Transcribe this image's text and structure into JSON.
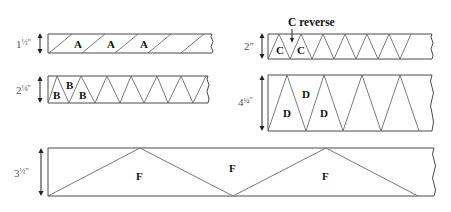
{
  "strips": [
    {
      "id": "A",
      "dimension": "1½\"",
      "dimension_whole": "1",
      "dimension_frac": "½\"",
      "labels": [
        "A",
        "A",
        "A"
      ],
      "cut_pattern": "parallel diagonals"
    },
    {
      "id": "B",
      "dimension": "2⅛\"",
      "dimension_whole": "2",
      "dimension_frac": "⅛\"",
      "labels": [
        "B",
        "B",
        "B"
      ],
      "cut_pattern": "alternating triangles"
    },
    {
      "id": "C",
      "dimension": "2\"",
      "dimension_whole": "2\"",
      "dimension_frac": "",
      "labels": [
        "C",
        "C"
      ],
      "callout": "C reverse",
      "cut_pattern": "alternating triangles"
    },
    {
      "id": "D",
      "dimension": "4¼\"",
      "dimension_whole": "4",
      "dimension_frac": "¼\"",
      "labels": [
        "D",
        "D",
        "D"
      ],
      "cut_pattern": "alternating tall triangles"
    },
    {
      "id": "F",
      "dimension": "3½\"",
      "dimension_whole": "3",
      "dimension_frac": "½\"",
      "labels": [
        "F",
        "F",
        "F"
      ],
      "cut_pattern": "alternating wide triangles"
    }
  ],
  "colors": {
    "line": "#4a4a4a",
    "label": "#111111",
    "dimension": "#555555"
  }
}
